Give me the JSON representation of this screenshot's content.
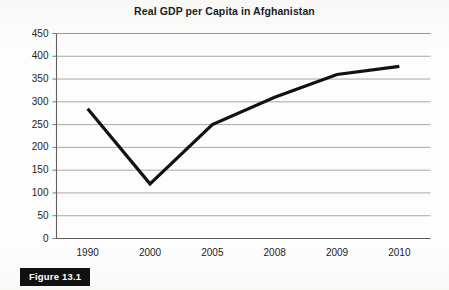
{
  "figure": {
    "badge_label": "Figure 13.1"
  },
  "chart_data": {
    "type": "line",
    "title": "Real GDP per Capita in Afghanistan",
    "xlabel": "",
    "ylabel": "",
    "categories": [
      "1990",
      "2000",
      "2005",
      "2008",
      "2009",
      "2010"
    ],
    "values": [
      285,
      120,
      250,
      310,
      360,
      378
    ],
    "series": [
      {
        "name": "Real GDP per Capita",
        "values": [
          285,
          120,
          250,
          310,
          360,
          378
        ]
      }
    ],
    "ylim": [
      0,
      450
    ],
    "ytick_step": 50,
    "yticks": [
      "450",
      "400",
      "350",
      "300",
      "250",
      "200",
      "150",
      "100",
      "50",
      "0"
    ],
    "grid": true,
    "legend": "none",
    "line_color": "#111111",
    "grid_color": "#a8a8a8",
    "axis_color": "#7a7a7a",
    "plot_background": "#ffffff"
  }
}
